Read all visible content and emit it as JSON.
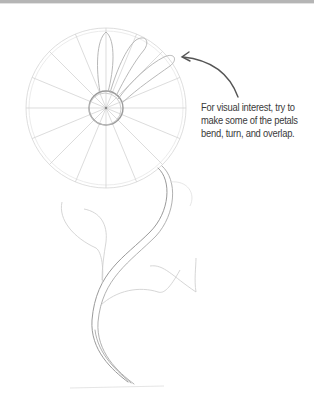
{
  "caption": {
    "lines": [
      "For visual interest, try to",
      "make some of the petals",
      "bend, turn, and overlap."
    ]
  },
  "colors": {
    "pencil_light": "#cfcfcf",
    "pencil_mid": "#a9a9a9",
    "pencil_dark": "#8a8a8a",
    "arrow": "#555555",
    "text": "#3a3a3a",
    "top_bar": "#b5b5b5"
  },
  "drawing": {
    "head_center": [
      106,
      108
    ],
    "outer_radius": 80,
    "inner_radius": 17,
    "petal_guides": 16,
    "drawn_petals": 3
  }
}
